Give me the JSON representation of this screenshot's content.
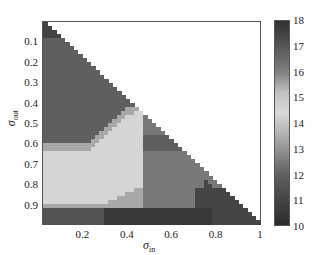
{
  "chart_data": {
    "type": "heatmap",
    "title": "",
    "xlabel": "σ_in",
    "ylabel": "σ_out",
    "xlim": [
      0.02,
      1.0
    ],
    "ylim": [
      0.02,
      1.0
    ],
    "y_inverted": true,
    "x_ticks": [
      "0.2",
      "0.4",
      "0.6",
      "0.8",
      "1"
    ],
    "y_ticks": [
      "0.1",
      "0.2",
      "0.3",
      "0.4",
      "0.5",
      "0.6",
      "0.7",
      "0.8",
      "0.9"
    ],
    "colorbar": {
      "min": 10,
      "max": 18,
      "ticks": [
        "18",
        "17",
        "16",
        "15",
        "14",
        "13",
        "12",
        "11",
        "10"
      ]
    },
    "grid_size": 50,
    "valid_region": "sigma_in <= sigma_out (lower-left triangle); upper-right is blank",
    "regions": [
      {
        "name": "top-corner",
        "value": 17.5,
        "desc": "sigma_out < 0.1"
      },
      {
        "name": "upper-body",
        "value": 16.8,
        "desc": "0.1 <= sigma_out < ~0.6"
      },
      {
        "name": "light-band",
        "value": 14.5,
        "desc": "band from left at sigma_out 0.68-0.9 curving up to diagonal near 0.45"
      },
      {
        "name": "transition-strip",
        "value": 15.5,
        "desc": "thin strip between upper-body and light band"
      },
      {
        "name": "mid-right",
        "value": 16.2,
        "desc": "sigma_in 0.45-0.8, sigma_out 0.5-0.9"
      },
      {
        "name": "bottom-dark",
        "value": 10.5,
        "desc": "sigma_out > 0.9, sigma_in 0.3-0.8"
      },
      {
        "name": "bottom-left",
        "value": 11.5,
        "desc": "sigma_out > 0.92, sigma_in < 0.3"
      },
      {
        "name": "diagonal-dark-patches",
        "value": 11,
        "desc": "near diagonal sigma_in 0.75-0.95"
      }
    ]
  }
}
